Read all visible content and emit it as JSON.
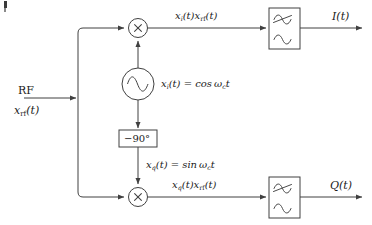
{
  "diagram": {
    "type": "block-diagram",
    "stroke_color": "#404040",
    "text_color": "#1a1a1a",
    "background": "#ffffff"
  },
  "input": {
    "label_top": "RF",
    "label_bottom_main": "x",
    "label_bottom_sub": "rf",
    "label_bottom_tail": "(t)"
  },
  "branches": {
    "i": {
      "product_main": "x",
      "product_sub": "i",
      "product_mid": "(t)x",
      "product_sub2": "rf",
      "product_tail": "(t)",
      "output": "I(t)"
    },
    "q": {
      "product_main": "x",
      "product_sub": "q",
      "product_mid": "(t)x",
      "product_sub2": "rf",
      "product_tail": "(t)",
      "output": "Q(t)"
    }
  },
  "oscillator": {
    "symbol": "sine-wave",
    "eq_main": "x",
    "eq_sub": "i",
    "eq_rest": "(t) = cos",
    "eq_omega": "ω",
    "eq_omega_sub": "c",
    "eq_t": "t"
  },
  "phase_shifter": {
    "label": "−90°"
  },
  "quadrature": {
    "eq_main": "x",
    "eq_sub": "q",
    "eq_rest": "(t) = sin",
    "eq_omega": "ω",
    "eq_omega_sub": "c",
    "eq_t": "t"
  },
  "mixers": {
    "symbol": "multiply-x",
    "label": "×"
  },
  "filters": {
    "symbol": "lowpass-filter",
    "description": "crossed sine over plain sine"
  }
}
